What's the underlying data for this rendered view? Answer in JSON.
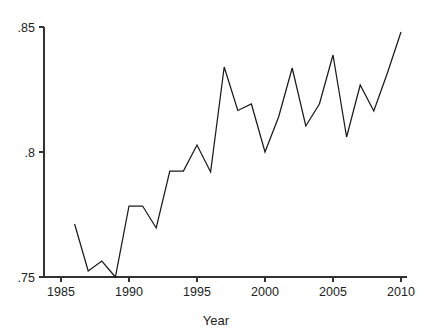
{
  "chart_data": {
    "type": "line",
    "title": "",
    "subtitle": "",
    "xlabel": "Year",
    "ylabel": "",
    "x": [
      1986,
      1987,
      1988,
      1989,
      1990,
      1991,
      1992,
      1993,
      1994,
      1995,
      1996,
      1997,
      1998,
      1999,
      2000,
      2001,
      2002,
      2003,
      2004,
      2005,
      2006,
      2007,
      2008,
      2009,
      2010
    ],
    "values": [
      0.7712,
      0.7524,
      0.7564,
      0.75,
      0.7784,
      0.7784,
      0.7696,
      0.7924,
      0.7924,
      0.8028,
      0.792,
      0.834,
      0.8166,
      0.8192,
      0.8,
      0.814,
      0.8336,
      0.8104,
      0.8192,
      0.8388,
      0.806,
      0.8268,
      0.8164,
      0.8316,
      0.848
    ],
    "series": [
      {
        "name": "series-1",
        "values": [
          0.7712,
          0.7524,
          0.7564,
          0.75,
          0.7784,
          0.7784,
          0.7696,
          0.7924,
          0.7924,
          0.8028,
          0.792,
          0.834,
          0.8166,
          0.8192,
          0.8,
          0.814,
          0.8336,
          0.8104,
          0.8192,
          0.8388,
          0.806,
          0.8268,
          0.8164,
          0.8316,
          0.848
        ]
      }
    ],
    "xlim": [
      1983.5,
      2010.8
    ],
    "ylim": [
      0.75,
      0.85
    ],
    "xticks": [
      1985,
      1990,
      1995,
      2000,
      2005,
      2010
    ],
    "xtick_labels": [
      "1985",
      "1990",
      "1995",
      "2000",
      "2005",
      "2010"
    ],
    "yticks": [
      0.75,
      0.8,
      0.85
    ],
    "ytick_labels": [
      ".75",
      ".8",
      ".85"
    ],
    "grid": false,
    "legend": false,
    "legend_position": "none",
    "line_color": "#1a1a1a",
    "axis_color": "#333333",
    "background_color": "#ffffff"
  }
}
